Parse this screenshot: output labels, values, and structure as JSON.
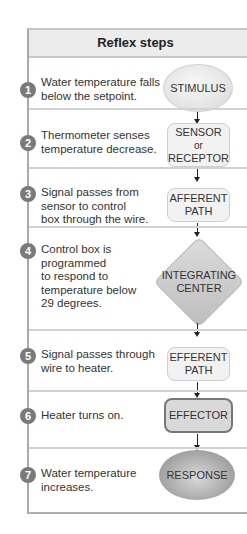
{
  "header": {
    "title": "Reflex steps"
  },
  "steps": [
    {
      "number": "1",
      "description": "Water temperature falls below the setpoint.",
      "shape_label": "STIMULUS",
      "shape": "light-ellipse"
    },
    {
      "number": "2",
      "description": "Thermometer senses temperature decrease.",
      "shape_label_lines": [
        "SENSOR",
        "or",
        "RECEPTOR"
      ],
      "shape": "light-rounded-box"
    },
    {
      "number": "3",
      "description": "Signal passes from sensor to control box through the wire.",
      "shape_label_lines": [
        "AFFERENT",
        "PATH"
      ],
      "shape": "light-rounded-box"
    },
    {
      "number": "4",
      "description": "Control box is programmed to respond to temperature below 29 degrees.",
      "shape_label_lines": [
        "INTEGRATING",
        "CENTER"
      ],
      "shape": "diamond"
    },
    {
      "number": "5",
      "description": "Signal passes through wire to heater.",
      "shape_label_lines": [
        "EFFERENT",
        "PATH"
      ],
      "shape": "light-rounded-box"
    },
    {
      "number": "6",
      "description": "Heater turns on.",
      "shape_label": "EFFECTOR",
      "shape": "dark-rounded-box"
    },
    {
      "number": "7",
      "description": "Water temperature increases.",
      "shape_label": "RESPONSE",
      "shape": "dark-ellipse"
    }
  ],
  "desc_lines": {
    "s1": [
      "Water temperature falls",
      "below the setpoint."
    ],
    "s2": [
      "Thermometer senses",
      "temperature decrease."
    ],
    "s3": [
      "Signal passes from",
      "sensor to control",
      "box through the wire."
    ],
    "s4": [
      "Control box is",
      "programmed",
      "to respond to",
      "temperature below",
      "29 degrees."
    ],
    "s5": [
      "Signal passes through",
      "wire to heater."
    ],
    "s6": [
      "Heater turns on."
    ],
    "s7": [
      "Water temperature",
      "increases."
    ]
  },
  "colors": {
    "number_badge": "#7a7a7a",
    "header_bg": "#ececec",
    "border": "#a8a8a8"
  }
}
